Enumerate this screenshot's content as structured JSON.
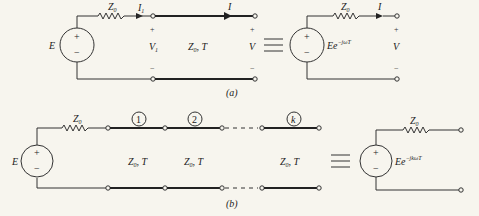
{
  "figure_a": {
    "caption": "(a)",
    "source_label": "E",
    "source_plus": "+",
    "source_minus": "−",
    "series_impedance": "Z",
    "series_impedance_sub": "0",
    "input_current": "I",
    "input_current_sub": "1",
    "input_voltage": "V",
    "input_voltage_sub": "1",
    "line_label": "Z",
    "line_label_sub": "0",
    "line_label_rest": ", T",
    "output_current": "I",
    "output_voltage": "V",
    "plus": "+",
    "minus": "−",
    "equivalent": {
      "source_label": "Ee",
      "source_exponent": "−jωT",
      "series_impedance": "Z",
      "series_impedance_sub": "0",
      "output_current": "I",
      "output_voltage": "V"
    }
  },
  "figure_b": {
    "caption": "(b)",
    "source_label": "E",
    "series_impedance": "Z",
    "series_impedance_sub": "0",
    "sections": [
      {
        "index": "1",
        "label": "Z",
        "label_sub": "0",
        "label_rest": ", T"
      },
      {
        "index": "2",
        "label": "Z",
        "label_sub": "0",
        "label_rest": ", T"
      },
      {
        "index": "k",
        "label": "Z",
        "label_sub": "0",
        "label_rest": ", T"
      }
    ],
    "equivalent": {
      "source_label": "Ee",
      "source_exponent": "−jkωT",
      "series_impedance": "Z",
      "series_impedance_sub": "0"
    }
  }
}
